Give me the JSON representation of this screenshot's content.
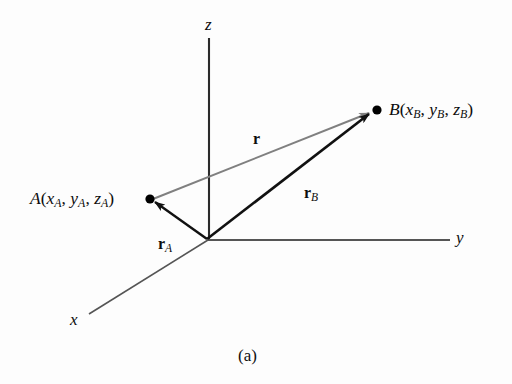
{
  "figure": {
    "caption": "(a)",
    "background_color": "#fdfdfd"
  },
  "axes": {
    "z": {
      "label": "z",
      "color": "#2b2b2b"
    },
    "y": {
      "label": "y",
      "color": "#555555"
    },
    "x": {
      "label": "x",
      "color": "#555555"
    }
  },
  "points": {
    "A": {
      "name": "A",
      "open_paren": "(",
      "close_paren": ")",
      "coord_x": "x",
      "coord_y": "y",
      "coord_z": "z",
      "subscript": "A",
      "sep": ", ",
      "dot_color": "#000000"
    },
    "B": {
      "name": "B",
      "open_paren": "(",
      "close_paren": ")",
      "coord_x": "x",
      "coord_y": "y",
      "coord_z": "z",
      "subscript": "B",
      "sep": ", ",
      "dot_color": "#000000"
    }
  },
  "vectors": {
    "r": {
      "symbol": "r",
      "subscript": "",
      "color": "#808080"
    },
    "rA": {
      "symbol": "r",
      "subscript": "A",
      "color": "#111111"
    },
    "rB": {
      "symbol": "r",
      "subscript": "B",
      "color": "#111111"
    }
  }
}
